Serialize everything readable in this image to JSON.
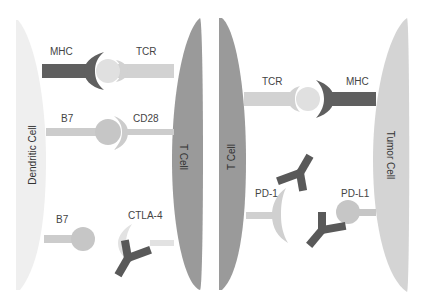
{
  "colors": {
    "dark": "#5f5f5f",
    "tcell": "#9a9a9a",
    "light": "#c6c6c6",
    "pale": "#dcdcdc",
    "dendritic": "#efefef",
    "tumor": "#d4d4d4",
    "antibody": "#595959"
  },
  "left_panel": {
    "dendritic_cell_label": "Dendritic Cell",
    "t_cell_label": "T Cell",
    "mhc_label": "MHC",
    "tcr_label": "TCR",
    "b7_top_label": "B7",
    "cd28_label": "CD28",
    "b7_bottom_label": "B7",
    "ctla4_label": "CTLA-4"
  },
  "right_panel": {
    "t_cell_label": "T Cell",
    "tumor_cell_label": "Tumor Cell",
    "tcr_label": "TCR",
    "mhc_label": "MHC",
    "pd1_label": "PD-1",
    "pdl1_label": "PD-L1"
  }
}
